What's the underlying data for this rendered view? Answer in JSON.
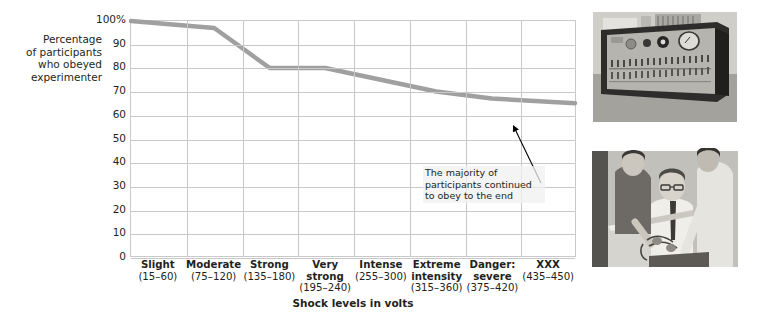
{
  "chart_data": {
    "type": "line",
    "title": "",
    "xlabel": "Shock levels in volts",
    "ylabel": "Percentage\nof participants\nwho obeyed\nexperimenter",
    "categories": [
      "Slight",
      "Moderate",
      "Strong",
      "Very\nstrong",
      "Intense",
      "Extreme\nintensity",
      "Danger:\nsevere",
      "XXX"
    ],
    "category_ranges": [
      "(15–60)",
      "(75–120)",
      "(135–180)",
      "(195–240)",
      "(255–300)",
      "(315–360)",
      "(375–420)",
      "(435–450)"
    ],
    "values": [
      100,
      97,
      80,
      80,
      75,
      70,
      67,
      65
    ],
    "ylim": [
      0,
      100
    ],
    "ytick_labels": [
      "100%",
      "90",
      "80",
      "70",
      "60",
      "50",
      "40",
      "30",
      "20",
      "10",
      "0"
    ],
    "ytick_values": [
      100,
      90,
      80,
      70,
      60,
      50,
      40,
      30,
      20,
      10,
      0
    ],
    "grid": true,
    "legend": "none",
    "line_color": "#a0a0a0",
    "grid_color": "#c8c8c8",
    "annotations": [
      {
        "text": "The majority of\nparticipants continued\nto obey to the end",
        "points_to_category": "XXX"
      }
    ]
  },
  "y_axis": {
    "title": "Percentage\nof participants\nwho obeyed\nexperimenter",
    "ticks": [
      "100%",
      "90",
      "80",
      "70",
      "60",
      "50",
      "40",
      "30",
      "20",
      "10",
      "0"
    ]
  },
  "x_axis": {
    "title": "Shock levels in volts",
    "ticks": [
      {
        "label": "Slight",
        "range": "(15–60)"
      },
      {
        "label": "Moderate",
        "range": "(75–120)"
      },
      {
        "label": "Strong",
        "range": "(135–180)"
      },
      {
        "label": "Very\nstrong",
        "range": "(195–240)"
      },
      {
        "label": "Intense",
        "range": "(255–300)"
      },
      {
        "label": "Extreme\nintensity",
        "range": "(315–360)"
      },
      {
        "label": "Danger:\nsevere",
        "range": "(375–420)"
      },
      {
        "label": "XXX",
        "range": "(435–450)"
      }
    ]
  },
  "annotation": {
    "text": "The majority of participants continued to obey to the end"
  },
  "photos": {
    "generator_caption": "shock-generator-photo",
    "learner_caption": "learner-electrode-chair-photo",
    "credit": "Stanley Milgram, from the film Obedience. Rights held by Alexandra Milgram."
  }
}
